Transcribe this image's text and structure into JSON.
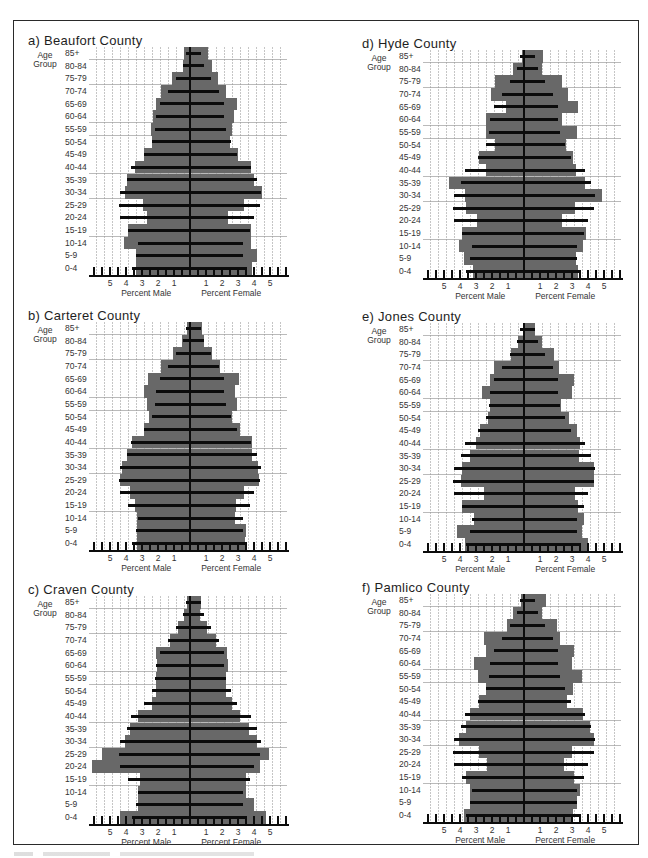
{
  "figure": {
    "age_group_header": "Age\nGroup",
    "x_axis": {
      "male_label": "Percent Male",
      "female_label": "Percent Female",
      "male_ticks": [
        "5",
        "4",
        "3",
        "2",
        "1"
      ],
      "female_ticks": [
        "1",
        "2",
        "3",
        "4",
        "5"
      ]
    },
    "colors": {
      "county_bars": "#686868",
      "reference_lines": "#0c0c0c",
      "grid": "#969696"
    }
  },
  "chart_data": [
    {
      "type": "bar",
      "subtype": "population-pyramid",
      "title": "a) Beaufort County",
      "ylabel": "Age Group",
      "xlabel_left": "Percent Male",
      "xlabel_right": "Percent Female",
      "xlim": [
        -6,
        6
      ],
      "grid": true,
      "categories": [
        "85+",
        "80-84",
        "75-79",
        "70-74",
        "65-69",
        "60-64",
        "55-59",
        "50-54",
        "45-49",
        "40-44",
        "35-39",
        "30-34",
        "25-29",
        "20-24",
        "15-19",
        "10-14",
        "5-9",
        "0-4"
      ],
      "series": [
        {
          "name": "County Male (%)",
          "values": [
            0.35,
            0.45,
            1.15,
            1.8,
            2.1,
            2.3,
            2.45,
            2.35,
            2.9,
            3.45,
            3.95,
            4.05,
            2.95,
            2.7,
            3.85,
            4.15,
            3.4,
            3.35
          ]
        },
        {
          "name": "County Female (%)",
          "values": [
            1.1,
            1.4,
            1.75,
            2.25,
            2.95,
            2.75,
            2.65,
            2.5,
            3.0,
            3.8,
            4.0,
            4.5,
            3.4,
            2.4,
            3.8,
            3.8,
            4.2,
            3.85
          ]
        },
        {
          "name": "Reference Male (%)",
          "values": [
            0.25,
            0.45,
            0.85,
            1.35,
            1.85,
            2.1,
            2.2,
            2.4,
            2.9,
            3.7,
            3.95,
            4.4,
            4.45,
            4.4,
            3.85,
            3.25,
            3.4,
            3.6
          ]
        },
        {
          "name": "Reference Female (%)",
          "values": [
            0.7,
            0.9,
            1.3,
            1.8,
            2.1,
            2.1,
            2.25,
            2.55,
            2.95,
            3.8,
            4.2,
            4.45,
            4.4,
            4.0,
            3.75,
            3.3,
            3.3,
            3.45
          ]
        }
      ]
    },
    {
      "type": "bar",
      "subtype": "population-pyramid",
      "title": "b) Carteret County",
      "ylabel": "Age Group",
      "xlabel_left": "Percent Male",
      "xlabel_right": "Percent Female",
      "xlim": [
        -6,
        6
      ],
      "grid": true,
      "categories": [
        "85+",
        "80-84",
        "75-79",
        "70-74",
        "65-69",
        "60-64",
        "55-59",
        "50-54",
        "45-49",
        "40-44",
        "35-39",
        "30-34",
        "25-29",
        "20-24",
        "15-19",
        "10-14",
        "5-9",
        "0-4"
      ],
      "series": [
        {
          "name": "County Male (%)",
          "values": [
            0.2,
            0.5,
            1.05,
            1.8,
            2.6,
            2.85,
            2.7,
            2.55,
            2.9,
            3.65,
            3.95,
            4.25,
            4.35,
            3.75,
            3.45,
            3.3,
            3.3,
            3.3
          ]
        },
        {
          "name": "County Female (%)",
          "values": [
            0.75,
            0.9,
            1.4,
            1.9,
            3.05,
            2.8,
            2.95,
            2.65,
            3.1,
            3.9,
            3.85,
            4.25,
            4.3,
            3.4,
            2.9,
            2.8,
            3.5,
            3.45
          ]
        },
        {
          "name": "Reference Male (%)",
          "values": [
            0.25,
            0.45,
            0.85,
            1.35,
            1.85,
            2.1,
            2.2,
            2.4,
            2.9,
            3.7,
            3.95,
            4.4,
            4.45,
            4.4,
            3.85,
            3.25,
            3.4,
            3.6
          ]
        },
        {
          "name": "Reference Female (%)",
          "values": [
            0.7,
            0.9,
            1.3,
            1.8,
            2.1,
            2.1,
            2.25,
            2.55,
            2.95,
            3.8,
            4.2,
            4.45,
            4.4,
            4.0,
            3.75,
            3.3,
            3.3,
            3.45
          ]
        }
      ]
    },
    {
      "type": "bar",
      "subtype": "population-pyramid",
      "title": "c) Craven County",
      "ylabel": "Age Group",
      "xlabel_left": "Percent Male",
      "xlabel_right": "Percent Female",
      "xlim": [
        -6,
        6
      ],
      "grid": true,
      "categories": [
        "85+",
        "80-84",
        "75-79",
        "70-74",
        "65-69",
        "60-64",
        "55-59",
        "50-54",
        "45-49",
        "40-44",
        "35-39",
        "30-34",
        "25-29",
        "20-24",
        "15-19",
        "10-14",
        "5-9",
        "0-4"
      ],
      "series": [
        {
          "name": "County Male (%)",
          "values": [
            0.2,
            0.35,
            0.75,
            1.25,
            2.1,
            2.05,
            2.1,
            2.1,
            2.4,
            3.25,
            3.75,
            4.05,
            5.5,
            6.1,
            3.1,
            3.25,
            3.25,
            4.4
          ]
        },
        {
          "name": "County Female (%)",
          "values": [
            0.7,
            0.65,
            1.05,
            1.6,
            2.3,
            2.35,
            2.25,
            2.25,
            2.65,
            3.15,
            3.7,
            4.2,
            4.95,
            4.4,
            3.5,
            3.5,
            4.0,
            4.75
          ]
        },
        {
          "name": "Reference Male (%)",
          "values": [
            0.25,
            0.45,
            0.85,
            1.35,
            1.85,
            2.1,
            2.2,
            2.4,
            2.9,
            3.7,
            3.95,
            4.4,
            4.45,
            4.4,
            3.85,
            3.25,
            3.4,
            3.6
          ]
        },
        {
          "name": "Reference Female (%)",
          "values": [
            0.7,
            0.9,
            1.3,
            1.8,
            2.1,
            2.1,
            2.25,
            2.55,
            2.95,
            3.8,
            4.2,
            4.45,
            4.4,
            4.0,
            3.75,
            3.3,
            3.3,
            3.45
          ]
        }
      ]
    },
    {
      "type": "bar",
      "subtype": "population-pyramid",
      "title": "d) Hyde County",
      "ylabel": "Age Group",
      "xlabel_left": "Percent Male",
      "xlabel_right": "Percent Female",
      "xlim": [
        -6,
        6
      ],
      "grid": true,
      "categories": [
        "85+",
        "80-84",
        "75-79",
        "70-74",
        "65-69",
        "60-64",
        "55-59",
        "50-54",
        "45-49",
        "40-44",
        "35-39",
        "30-34",
        "25-29",
        "20-24",
        "15-19",
        "10-14",
        "5-9",
        "0-4"
      ],
      "series": [
        {
          "name": "County Male (%)",
          "values": [
            0.1,
            0.7,
            1.8,
            2.05,
            1.1,
            2.4,
            2.4,
            1.8,
            2.8,
            2.4,
            4.7,
            3.7,
            3.6,
            2.95,
            3.85,
            4.05,
            3.75,
            3.2
          ]
        },
        {
          "name": "County Female (%)",
          "values": [
            1.2,
            1.1,
            2.4,
            2.75,
            3.4,
            2.4,
            3.3,
            2.6,
            3.05,
            3.25,
            3.8,
            4.9,
            3.2,
            2.35,
            3.85,
            3.7,
            3.25,
            3.35
          ]
        },
        {
          "name": "Reference Male (%)",
          "values": [
            0.25,
            0.45,
            0.85,
            1.35,
            1.85,
            2.1,
            2.2,
            2.4,
            2.9,
            3.7,
            3.95,
            4.4,
            4.45,
            4.4,
            3.85,
            3.25,
            3.4,
            3.6
          ]
        },
        {
          "name": "Reference Female (%)",
          "values": [
            0.7,
            0.9,
            1.3,
            1.8,
            2.1,
            2.1,
            2.25,
            2.55,
            2.95,
            3.8,
            4.2,
            4.45,
            4.4,
            4.0,
            3.75,
            3.3,
            3.3,
            3.45
          ]
        }
      ]
    },
    {
      "type": "bar",
      "subtype": "population-pyramid",
      "title": "e) Jones County",
      "ylabel": "Age Group",
      "xlabel_left": "Percent Male",
      "xlabel_right": "Percent Female",
      "xlim": [
        -6,
        6
      ],
      "grid": true,
      "categories": [
        "85+",
        "80-84",
        "75-79",
        "70-74",
        "65-69",
        "60-64",
        "55-59",
        "50-54",
        "45-49",
        "40-44",
        "35-39",
        "30-34",
        "25-29",
        "20-24",
        "15-19",
        "10-14",
        "5-9",
        "0-4"
      ],
      "series": [
        {
          "name": "County Male (%)",
          "values": [
            0.05,
            0.4,
            0.8,
            1.9,
            2.1,
            2.6,
            2.1,
            2.25,
            2.75,
            3.0,
            3.35,
            3.9,
            3.95,
            2.5,
            3.85,
            3.15,
            4.2,
            3.7
          ]
        },
        {
          "name": "County Female (%)",
          "values": [
            0.7,
            1.1,
            1.85,
            2.2,
            3.15,
            3.0,
            2.3,
            2.8,
            3.3,
            3.5,
            3.45,
            4.4,
            4.35,
            3.2,
            3.4,
            3.75,
            3.65,
            4.0
          ]
        },
        {
          "name": "Reference Male (%)",
          "values": [
            0.25,
            0.45,
            0.85,
            1.35,
            1.85,
            2.1,
            2.2,
            2.4,
            2.9,
            3.7,
            3.95,
            4.4,
            4.45,
            4.4,
            3.85,
            3.25,
            3.4,
            3.6
          ]
        },
        {
          "name": "Reference Female (%)",
          "values": [
            0.7,
            0.9,
            1.3,
            1.8,
            2.1,
            2.1,
            2.25,
            2.55,
            2.95,
            3.8,
            4.2,
            4.45,
            4.4,
            4.0,
            3.75,
            3.3,
            3.3,
            3.45
          ]
        }
      ]
    },
    {
      "type": "bar",
      "subtype": "population-pyramid",
      "title": "f) Pamlico County",
      "ylabel": "Age Group",
      "xlabel_left": "Percent Male",
      "xlabel_right": "Percent Female",
      "xlim": [
        -6,
        6
      ],
      "grid": true,
      "categories": [
        "85+",
        "80-84",
        "75-79",
        "70-74",
        "65-69",
        "60-64",
        "55-59",
        "50-54",
        "45-49",
        "40-44",
        "35-39",
        "30-34",
        "25-29",
        "20-24",
        "15-19",
        "10-14",
        "5-9",
        "0-4"
      ],
      "series": [
        {
          "name": "County Male (%)",
          "values": [
            0.2,
            0.7,
            1.05,
            2.5,
            2.4,
            3.15,
            2.9,
            2.4,
            2.8,
            3.4,
            3.6,
            4.05,
            2.8,
            2.3,
            3.6,
            3.35,
            3.35,
            3.75
          ]
        },
        {
          "name": "County Female (%)",
          "values": [
            1.35,
            1.1,
            2.05,
            2.25,
            3.1,
            3.0,
            3.6,
            3.05,
            2.7,
            3.7,
            4.1,
            4.4,
            3.0,
            2.5,
            3.1,
            3.5,
            3.3,
            3.05
          ]
        },
        {
          "name": "Reference Male (%)",
          "values": [
            0.25,
            0.45,
            0.85,
            1.35,
            1.85,
            2.1,
            2.2,
            2.4,
            2.9,
            3.7,
            3.95,
            4.4,
            4.45,
            4.4,
            3.85,
            3.25,
            3.4,
            3.6
          ]
        },
        {
          "name": "Reference Female (%)",
          "values": [
            0.7,
            0.9,
            1.3,
            1.8,
            2.1,
            2.1,
            2.25,
            2.55,
            2.95,
            3.8,
            4.2,
            4.45,
            4.4,
            4.0,
            3.75,
            3.3,
            3.3,
            3.45
          ]
        }
      ]
    }
  ]
}
